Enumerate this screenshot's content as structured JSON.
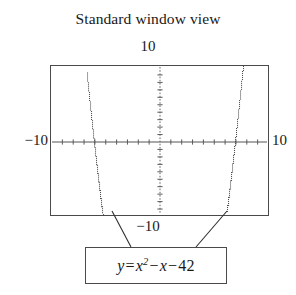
{
  "title": "Standard window view",
  "axis_labels": {
    "top": "10",
    "left": "−10",
    "right": "10",
    "bottom": "−10"
  },
  "equation": {
    "lhs": "y",
    "equals": "=",
    "base": "x",
    "exponent": "2",
    "term2_op": "−",
    "term2": "x",
    "term3_op": "−",
    "term3": "42",
    "full_text": "y = x² − x − 42"
  },
  "colors": {
    "frame": "#4a4a4a",
    "axis": "#555555",
    "curve": "#4d4d4d",
    "text": "#181818",
    "background": "#ffffff"
  },
  "chart_data": {
    "type": "line",
    "title": "Standard window view",
    "annotation": "y = x² − x − 42",
    "xlabel": "",
    "ylabel": "",
    "xlim": [
      -10,
      10
    ],
    "ylim": [
      -10,
      10
    ],
    "grid": false,
    "legend": null,
    "axis_tick_interval": 1,
    "x_tick_labels": [
      "−10",
      "10"
    ],
    "y_tick_labels": [
      "−10",
      "10"
    ],
    "line_style": "dotted",
    "series": [
      {
        "name": "y = x^2 - x - 42",
        "roots": [
          -6,
          7
        ],
        "vertex": [
          0.5,
          -42.25
        ],
        "x": [
          -10,
          -9.5,
          -9,
          -8.5,
          -8,
          -7.5,
          -7,
          -6.8,
          -6.6,
          -6.4,
          -6.2,
          -6,
          -5.8,
          -5.6,
          -5.4,
          -5.2,
          -5,
          -4.8,
          -4.6,
          -4.4,
          -4.2,
          -4,
          6,
          6.2,
          6.4,
          6.6,
          6.8,
          7,
          7.2,
          7.4,
          7.6,
          7.8,
          8,
          8.5,
          9,
          9.5,
          10
        ],
        "values": [
          68,
          57.75,
          48,
          38.75,
          30,
          21.75,
          14,
          11.04,
          8.16,
          5.36,
          2.64,
          0,
          -2.56,
          -5.04,
          -7.44,
          -9.76,
          -12,
          -14.16,
          -16.24,
          -18.24,
          -20.16,
          -22,
          -12,
          -10.16,
          -8.24,
          -6.24,
          -4.16,
          0,
          2.64,
          5.36,
          8.16,
          11.04,
          14,
          21.75,
          30,
          38.75,
          48
        ]
      }
    ]
  }
}
